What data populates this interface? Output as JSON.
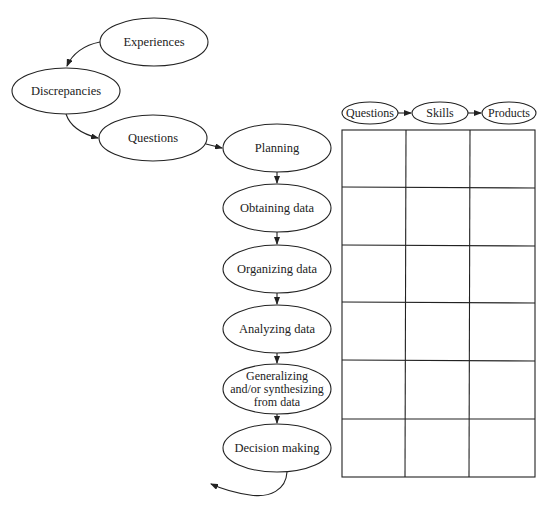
{
  "diagram": {
    "type": "inquiry-process-flow",
    "colors": {
      "stroke": "#222222",
      "background": "#ffffff",
      "text": "#222222"
    },
    "entry_nodes": [
      {
        "id": "experiences",
        "label": "Experiences"
      },
      {
        "id": "discrepancies",
        "label": "Discrepancies"
      },
      {
        "id": "questions",
        "label": "Questions"
      }
    ],
    "process_nodes": [
      {
        "id": "planning",
        "label": "Planning"
      },
      {
        "id": "obtaining",
        "label": "Obtaining data"
      },
      {
        "id": "organizing",
        "label": "Organizing data"
      },
      {
        "id": "analyzing",
        "label": "Analyzing data"
      },
      {
        "id": "generalizing",
        "label": "Generalizing\nand/or synthesizing\nfrom data"
      },
      {
        "id": "decision",
        "label": "Decision making"
      }
    ],
    "matrix": {
      "headers": [
        {
          "id": "questions",
          "label": "Questions"
        },
        {
          "id": "skills",
          "label": "Skills"
        },
        {
          "id": "products",
          "label": "Products"
        }
      ],
      "rows": 6,
      "cols": 3
    },
    "edges": [
      {
        "from": "experiences",
        "to": "discrepancies"
      },
      {
        "from": "discrepancies",
        "to": "questions"
      },
      {
        "from": "questions",
        "to": "planning"
      },
      {
        "from": "planning",
        "to": "obtaining"
      },
      {
        "from": "obtaining",
        "to": "organizing"
      },
      {
        "from": "organizing",
        "to": "analyzing"
      },
      {
        "from": "analyzing",
        "to": "generalizing"
      },
      {
        "from": "generalizing",
        "to": "decision"
      },
      {
        "from": "decision",
        "to": "loop-back"
      },
      {
        "from": "matrix-questions",
        "to": "matrix-skills"
      },
      {
        "from": "matrix-skills",
        "to": "matrix-products"
      }
    ]
  }
}
